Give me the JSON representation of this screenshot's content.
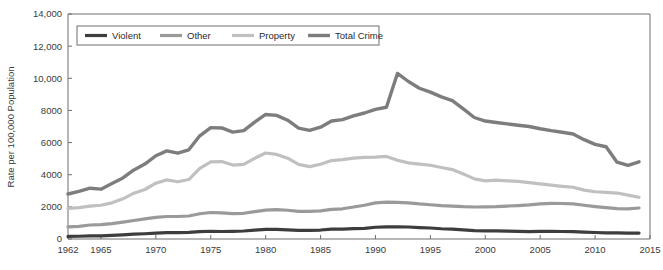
{
  "chart_data": {
    "type": "line",
    "title": "",
    "xlabel": "",
    "ylabel": "Rate per 100,000 Population",
    "xlim": [
      1962,
      2015
    ],
    "ylim": [
      0,
      14000
    ],
    "grid": false,
    "legend_position": "top-left",
    "x_ticks": [
      "1962",
      "1965",
      "1970",
      "1975",
      "1980",
      "1985",
      "1990",
      "1995",
      "2000",
      "2005",
      "2010",
      "2015"
    ],
    "x_tick_values": [
      1962,
      1965,
      1970,
      1975,
      1980,
      1985,
      1990,
      1995,
      2000,
      2005,
      2010,
      2015
    ],
    "y_ticks": [
      "0",
      "2000",
      "4000",
      "6000",
      "8000",
      "10,000",
      "12,000",
      "14,000"
    ],
    "y_tick_values": [
      0,
      2000,
      4000,
      6000,
      8000,
      10000,
      12000,
      14000
    ],
    "x": [
      1962,
      1963,
      1964,
      1965,
      1966,
      1967,
      1968,
      1969,
      1970,
      1971,
      1972,
      1973,
      1974,
      1975,
      1976,
      1977,
      1978,
      1979,
      1980,
      1981,
      1982,
      1983,
      1984,
      1985,
      1986,
      1987,
      1988,
      1989,
      1990,
      1991,
      1992,
      1993,
      1994,
      1995,
      1996,
      1997,
      1998,
      1999,
      2000,
      2001,
      2002,
      2003,
      2004,
      2005,
      2006,
      2007,
      2008,
      2009,
      2010,
      2011,
      2012,
      2013,
      2014
    ],
    "series": [
      {
        "name": "Violent",
        "color": "#3d3d3d",
        "width": 3.2,
        "values": [
          160,
          170,
          195,
          200,
          220,
          254,
          298,
          328,
          364,
          396,
          401,
          417,
          461,
          482,
          468,
          476,
          498,
          549,
          597,
          594,
          571,
          538,
          539,
          558,
          620,
          610,
          640,
          666,
          730,
          758,
          758,
          747,
          714,
          685,
          637,
          611,
          568,
          523,
          507,
          504,
          494,
          476,
          463,
          469,
          474,
          467,
          458,
          432,
          405,
          387,
          387,
          368,
          366
        ]
      },
      {
        "name": "Other",
        "color": "#9a9a9a",
        "width": 3.2,
        "values": [
          750,
          790,
          870,
          900,
          960,
          1050,
          1150,
          1250,
          1350,
          1400,
          1400,
          1430,
          1570,
          1650,
          1620,
          1580,
          1600,
          1700,
          1800,
          1830,
          1790,
          1720,
          1720,
          1750,
          1840,
          1880,
          1990,
          2100,
          2250,
          2300,
          2280,
          2250,
          2180,
          2130,
          2080,
          2050,
          2010,
          1990,
          2000,
          2010,
          2050,
          2080,
          2120,
          2180,
          2220,
          2210,
          2180,
          2100,
          2020,
          1950,
          1890,
          1880,
          1930
        ]
      },
      {
        "name": "Property",
        "color": "#c0c0c0",
        "width": 3.2,
        "values": [
          1900,
          1950,
          2050,
          2100,
          2250,
          2500,
          2850,
          3080,
          3470,
          3680,
          3560,
          3700,
          4390,
          4800,
          4820,
          4600,
          4640,
          5020,
          5350,
          5260,
          5030,
          4640,
          4500,
          4650,
          4880,
          4940,
          5030,
          5080,
          5090,
          5140,
          4900,
          4740,
          4660,
          4590,
          4450,
          4320,
          4050,
          3740,
          3620,
          3660,
          3620,
          3590,
          3510,
          3430,
          3350,
          3280,
          3220,
          3040,
          2940,
          2900,
          2860,
          2730,
          2600
        ]
      },
      {
        "name": "Total Crime",
        "color": "#7d7d7d",
        "width": 3.4,
        "values": [
          2800,
          2960,
          3160,
          3100,
          3450,
          3800,
          4300,
          4660,
          5180,
          5480,
          5340,
          5550,
          6420,
          6930,
          6910,
          6650,
          6740,
          7270,
          7750,
          7690,
          7390,
          6900,
          6760,
          6960,
          7340,
          7430,
          7660,
          7840,
          8070,
          8200,
          10300,
          9800,
          9380,
          9140,
          8840,
          8610,
          8100,
          7560,
          7340,
          7250,
          7160,
          7080,
          7000,
          6860,
          6740,
          6640,
          6530,
          6180,
          5890,
          5740,
          4780,
          4580,
          4800
        ]
      }
    ]
  },
  "legend": {
    "items": [
      {
        "label": "Violent"
      },
      {
        "label": "Other"
      },
      {
        "label": "Property"
      },
      {
        "label": "Total Crime"
      }
    ]
  }
}
